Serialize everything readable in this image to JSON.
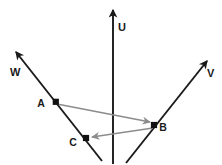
{
  "canvas": {
    "width": 222,
    "height": 165,
    "background": "#ffffff"
  },
  "colors": {
    "axis": "#1a1a1a",
    "vector": "#8c8c8c",
    "point": "#111111",
    "label": "#1a1a1a"
  },
  "axes": [
    {
      "name": "u-axis",
      "label": "U",
      "label_x": 118,
      "label_y": 31,
      "x1": 113,
      "y1": 164,
      "x2": 113,
      "y2": 10,
      "arrow_tip_x": 113,
      "arrow_tip_y": 6
    },
    {
      "name": "v-axis",
      "label": "V",
      "label_x": 207,
      "label_y": 77,
      "x1": 126,
      "y1": 163,
      "x2": 207,
      "y2": 61,
      "arrow_tip_x": 213,
      "arrow_tip_y": 54
    },
    {
      "name": "w-axis",
      "label": "W",
      "label_x": 10,
      "label_y": 76,
      "x1": 102,
      "y1": 161,
      "x2": 16,
      "y2": 52,
      "arrow_tip_x": 10,
      "arrow_tip_y": 44
    }
  ],
  "points": [
    {
      "name": "A",
      "label": "A",
      "x": 56,
      "y": 102,
      "label_x": 41,
      "label_y": 107
    },
    {
      "name": "B",
      "label": "B",
      "x": 154,
      "y": 125,
      "label_x": 160,
      "label_y": 131
    },
    {
      "name": "C",
      "label": "C",
      "x": 86,
      "y": 138,
      "label_x": 70,
      "label_y": 146
    }
  ],
  "vectors": [
    {
      "name": "vector-a-to-b",
      "from": "A",
      "to": "B",
      "x1": 57,
      "y1": 104,
      "x2": 150,
      "y2": 122,
      "arrow_tip_x": 154,
      "arrow_tip_y": 123
    },
    {
      "name": "vector-b-to-c",
      "from": "B",
      "to": "C",
      "x1": 153,
      "y1": 128,
      "x2": 92,
      "y2": 137,
      "arrow_tip_x": 87,
      "arrow_tip_y": 138
    }
  ]
}
